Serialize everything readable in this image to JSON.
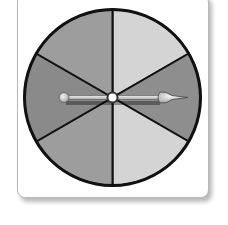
{
  "spinner": {
    "center": [
      112.5,
      97.5
    ],
    "radius": 88,
    "sector_count": 6,
    "sectors": [
      {
        "start_deg": -90,
        "end_deg": -30,
        "shade": "light",
        "color": "#d4d4d4"
      },
      {
        "start_deg": -30,
        "end_deg": 30,
        "shade": "dark",
        "color": "#8e8e8e"
      },
      {
        "start_deg": 30,
        "end_deg": 90,
        "shade": "light",
        "color": "#d4d4d4"
      },
      {
        "start_deg": 90,
        "end_deg": 150,
        "shade": "medium",
        "color": "#9d9d9d"
      },
      {
        "start_deg": 150,
        "end_deg": 210,
        "shade": "dark",
        "color": "#8a8a8a"
      },
      {
        "start_deg": 210,
        "end_deg": 270,
        "shade": "medium",
        "color": "#9d9d9d"
      }
    ],
    "outline_color": "#111111",
    "arrow": {
      "direction_deg": 0,
      "points_to": "right",
      "color": "#cfcfcf"
    }
  }
}
